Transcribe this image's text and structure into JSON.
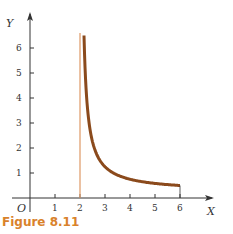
{
  "chart_data": {
    "type": "line",
    "title": "",
    "xlabel": "X",
    "ylabel": "Y",
    "origin_label": "O",
    "xlim": [
      0,
      6.8
    ],
    "ylim": [
      -0.5,
      6.8
    ],
    "x_ticks": [
      "1",
      "2",
      "3",
      "4",
      "5",
      "6"
    ],
    "y_ticks": [
      "1",
      "2",
      "3",
      "4",
      "5",
      "6"
    ],
    "grid": false,
    "series": [
      {
        "name": "curve",
        "color": "#8b4a1c",
        "x": [
          2.16,
          2.25,
          2.5,
          3,
          3.5,
          4,
          4.5,
          5,
          5.5,
          6
        ],
        "values": [
          6.5,
          4.25,
          2.25,
          1.25,
          0.92,
          0.75,
          0.65,
          0.58,
          0.54,
          0.5
        ]
      }
    ],
    "annotations": [
      {
        "type": "vertical_asymptote",
        "x": 2,
        "color": "#e0a070"
      }
    ]
  },
  "caption": "Figure 8.11",
  "colors": {
    "curve": "#8b4a1c",
    "asymptote": "#e0a070",
    "caption": "#d9822b",
    "axis": "#333333"
  }
}
